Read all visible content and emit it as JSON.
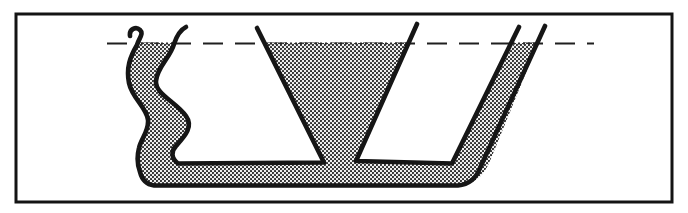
{
  "figure": {
    "name": "communicating-vessels-diagram",
    "canvas": {
      "width": "688",
      "height": "213",
      "background": "#ffffff"
    },
    "frame": {
      "d": "M16 14 H672 V202 H16 Z",
      "stroke": "#141414",
      "stroke_width": "3",
      "fill": "#ffffff"
    },
    "water_level_line": {
      "d": "M107 43.5 H594",
      "stroke": "#1f1f1f",
      "stroke_width": "2.2",
      "dash": "20 12"
    },
    "liquid": {
      "d": "M136 43 H173 C168 58 158 67 156 80 C154 94 176 102 186 116 C194 127 184 137 176 146 C171 152 172 158 178 163 L324 162 L265 43 L410 43 L356 162 L452 163 L514 43 L538 43 L490 161 Q481 183 462 185 L152 185 Q142 183 140 172 C138 160 137 152 139 147 C144 138 150 131 148 120 C146 108 133 99 129 84 C126 70 128 56 136 43 Z",
      "dot_color": "#222222",
      "bg_color": "#efefef"
    },
    "walls": {
      "stroke": "#161616",
      "stroke_width": "4.6",
      "outer_boundary_d": "M130 36 C129 29 136 26 140 30 C144 34 139 38 137 45 C130 57 126 68 129 83 C132 98 147 108 148 120 C149 131 141 139 139 148 C137 156 137 164 140 172 Q143 184 154 185.5 L458 185.5 Q474 184 480 168 L545 26",
      "left_tube_inner_and_funnel_left_d": "M186 27 C180 30 177 35 174 44 C170 58 157 67 156 81 C155 94 176 102 186 116 C194 127 184 137 176 146 C171 151 171 158 178 163.5 L324 162.5 L257 28",
      "funnel_right_and_right_tube_inner_d": "M417 24 L356 161 L452 163.5 L519 27"
    },
    "water_surface_edges": {
      "stroke": "#2a2a2a",
      "stroke_width": "2",
      "dash": "2 3",
      "left_tube_d": "M136 43.5 H174",
      "funnel_d": "M265 43.5 H410",
      "right_tube_d": "M513 43.5 H538"
    }
  }
}
